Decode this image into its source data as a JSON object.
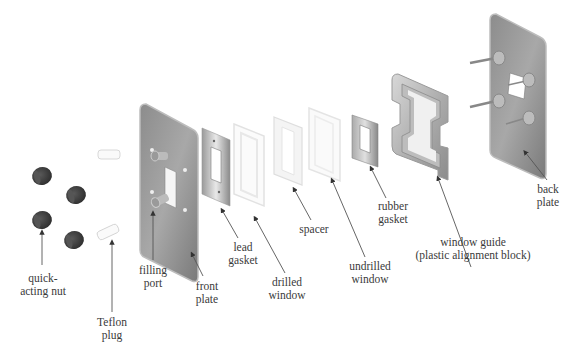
{
  "diagram": {
    "type": "exploded-view",
    "parts": [
      {
        "id": "quick-acting-nut",
        "label": "quick-\nacting nut",
        "line1": "quick-",
        "line2": "acting nut"
      },
      {
        "id": "teflon-plug",
        "label": "Teflon plug",
        "line1": "Teflon",
        "line2": "plug"
      },
      {
        "id": "filling-port",
        "label": "filling port",
        "line1": "filling",
        "line2": "port"
      },
      {
        "id": "front-plate",
        "label": "front plate",
        "line1": "front",
        "line2": "plate"
      },
      {
        "id": "lead-gasket",
        "label": "lead gasket",
        "line1": "lead",
        "line2": "gasket"
      },
      {
        "id": "drilled-window",
        "label": "drilled window",
        "line1": "drilled",
        "line2": "window"
      },
      {
        "id": "spacer",
        "label": "spacer",
        "line1": "spacer",
        "line2": ""
      },
      {
        "id": "undrilled-window",
        "label": "undrilled window",
        "line1": "undrilled",
        "line2": "window"
      },
      {
        "id": "rubber-gasket",
        "label": "rubber gasket",
        "line1": "rubber",
        "line2": "gasket"
      },
      {
        "id": "window-guide",
        "label": "window guide (plastic alignment block)",
        "line1": "window guide",
        "line2": "(plastic alignment block)"
      },
      {
        "id": "back-plate",
        "label": "back plate",
        "line1": "back",
        "line2": "plate"
      }
    ],
    "colors": {
      "metal_dark": "#7a7a7a",
      "metal_light": "#c8c8c8",
      "nut": "#3c3c3c",
      "window": "#f2f2f2",
      "label": "#3a3a3a",
      "leader": "#555555"
    }
  }
}
